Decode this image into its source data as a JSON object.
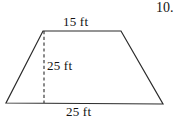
{
  "problem": {
    "number": "10."
  },
  "figure": {
    "shape_name": "trapezoid",
    "stroke_color": "#2b2b2b",
    "background_color": "#ffffff",
    "labels": {
      "top_side": "15 ft",
      "height": "25 ft",
      "bottom_side": "25 ft"
    },
    "geometry": {
      "top_left": [
        43,
        31
      ],
      "top_right": [
        121,
        31
      ],
      "bottom_right": [
        163,
        104
      ],
      "bottom_left": [
        6,
        103
      ],
      "height_line_x": 44,
      "height_line_top_y": 31,
      "height_line_bottom_y": 103
    }
  }
}
